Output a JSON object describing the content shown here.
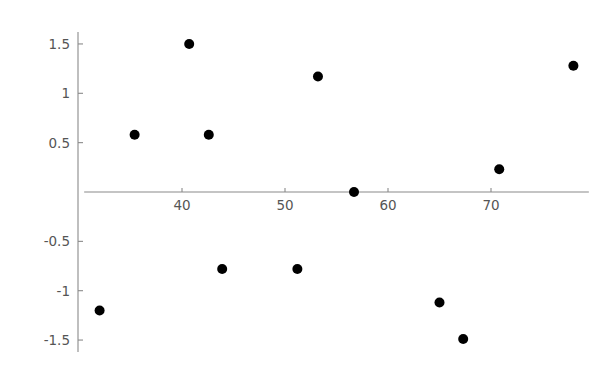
{
  "chart_data": {
    "type": "scatter",
    "title": "",
    "subtitle": "",
    "xlabel": "",
    "ylabel": "",
    "xlim": [
      30.5,
      79.5
    ],
    "ylim": [
      -1.62,
      1.62
    ],
    "grid": false,
    "legend": null,
    "x_ticks": [
      40,
      50,
      60,
      70
    ],
    "x_tick_labels": [
      "40",
      "50",
      "60",
      "70"
    ],
    "y_ticks": [
      1.5,
      1,
      0.5,
      -0.5,
      -1,
      -1.5
    ],
    "y_tick_labels": [
      "1.5",
      "1",
      "0.5",
      "-0.5",
      "-1",
      "-1.5"
    ],
    "marker_color": "#000000",
    "axis_color": "#8a8a8a",
    "tick_label_color": "#555555",
    "marker_size": 5,
    "points": [
      {
        "x": 32.0,
        "y": -1.2
      },
      {
        "x": 35.4,
        "y": 0.58
      },
      {
        "x": 40.7,
        "y": 1.5
      },
      {
        "x": 42.6,
        "y": 0.58
      },
      {
        "x": 43.9,
        "y": -0.78
      },
      {
        "x": 51.2,
        "y": -0.78
      },
      {
        "x": 53.2,
        "y": 1.17
      },
      {
        "x": 56.7,
        "y": 0.0
      },
      {
        "x": 65.0,
        "y": -1.12
      },
      {
        "x": 67.3,
        "y": -1.49
      },
      {
        "x": 70.8,
        "y": 0.23
      },
      {
        "x": 78.0,
        "y": 1.28
      }
    ],
    "x": [
      32.0,
      35.4,
      40.7,
      42.6,
      43.9,
      51.2,
      53.2,
      56.7,
      65.0,
      67.3,
      70.8,
      78.0
    ],
    "values": [
      -1.2,
      0.58,
      1.5,
      0.58,
      -0.78,
      -0.78,
      1.17,
      0.0,
      -1.12,
      -1.49,
      0.23,
      1.28
    ]
  }
}
